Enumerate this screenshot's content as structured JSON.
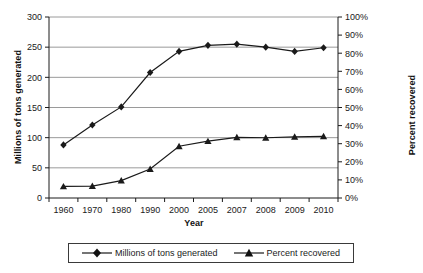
{
  "chart_data": {
    "type": "line",
    "title": "",
    "xlabel": "Year",
    "ylabel": "Millions of tons generated",
    "y2label": "Percent recovered",
    "categories": [
      "1960",
      "1970",
      "1980",
      "1990",
      "2000",
      "2005",
      "2007",
      "2008",
      "2009",
      "2010"
    ],
    "ylim": [
      0,
      300
    ],
    "y2lim": [
      0,
      100
    ],
    "yticks": [
      "0",
      "50",
      "100",
      "150",
      "200",
      "250",
      "300"
    ],
    "ytick_values": [
      0,
      50,
      100,
      150,
      200,
      250,
      300
    ],
    "y2ticks": [
      "0%",
      "10%",
      "20%",
      "30%",
      "40%",
      "50%",
      "60%",
      "70%",
      "80%",
      "90%",
      "100%"
    ],
    "y2tick_values": [
      0,
      10,
      20,
      30,
      40,
      50,
      60,
      70,
      80,
      90,
      100
    ],
    "grid": "horizontal",
    "legend_position": "bottom",
    "series": [
      {
        "name": "Millions of tons generated",
        "axis": "left",
        "marker": "diamond",
        "color": "#1a1a1a",
        "values": [
          88,
          121,
          151,
          208,
          243,
          253,
          255,
          250,
          243,
          249
        ]
      },
      {
        "name": "Percent recovered",
        "axis": "right",
        "marker": "triangle",
        "color": "#1a1a1a",
        "values": [
          6.4,
          6.6,
          9.6,
          16.0,
          28.6,
          31.4,
          33.5,
          33.3,
          33.8,
          34.1
        ]
      }
    ]
  },
  "legend": {
    "entries": [
      {
        "label": "Millions of tons generated",
        "marker": "diamond-marker-icon"
      },
      {
        "label": "Percent recovered",
        "marker": "triangle-marker-icon"
      }
    ]
  },
  "axes": {
    "x_title": "Year",
    "y_left_title": "Millions of tons generated",
    "y_right_title": "Percent recovered"
  }
}
